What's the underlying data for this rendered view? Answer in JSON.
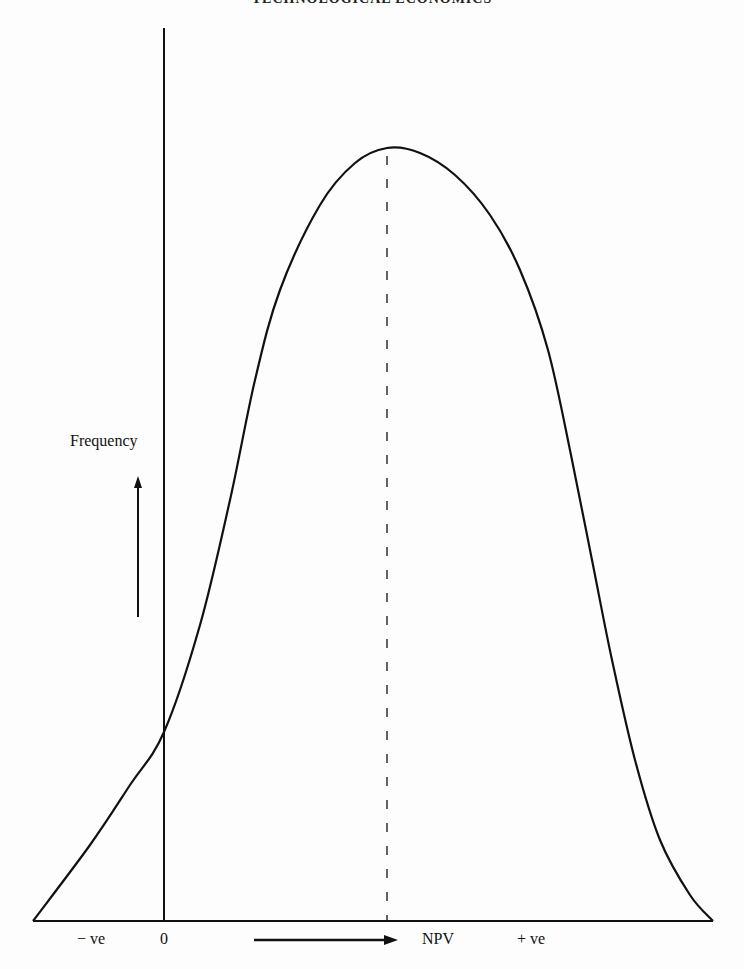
{
  "page": {
    "running_header": "TECHNOLOGICAL ECONOMICS"
  },
  "chart_data": {
    "type": "line",
    "title": "",
    "xlabel": "NPV",
    "ylabel": "Frequency",
    "x_tick_labels": [
      "−ve",
      "0",
      "NPV",
      "+ve"
    ],
    "x_axis_arrow": "right",
    "y_axis_arrow": "up",
    "grid": false,
    "legend": null,
    "annotations": [
      {
        "type": "dashed-vertical-line",
        "at": "expected NPV (peak)"
      }
    ],
    "curve_points_px": [
      [
        33,
        921
      ],
      [
        90,
        845
      ],
      [
        130,
        785
      ],
      [
        164,
        732
      ],
      [
        200,
        625
      ],
      [
        230,
        500
      ],
      [
        255,
        380
      ],
      [
        280,
        290
      ],
      [
        320,
        205
      ],
      [
        355,
        163
      ],
      [
        387,
        148
      ],
      [
        420,
        153
      ],
      [
        455,
        175
      ],
      [
        490,
        215
      ],
      [
        520,
        270
      ],
      [
        548,
        350
      ],
      [
        572,
        460
      ],
      [
        592,
        560
      ],
      [
        612,
        660
      ],
      [
        635,
        760
      ],
      [
        660,
        840
      ],
      [
        690,
        895
      ],
      [
        713,
        921
      ]
    ]
  },
  "labels": {
    "frequency": "Frequency",
    "neg": "− ve",
    "zero": "0",
    "npv": "NPV",
    "pos": "+ ve"
  },
  "colors": {
    "ink": "#111111",
    "paper": "#fdfdfd"
  }
}
